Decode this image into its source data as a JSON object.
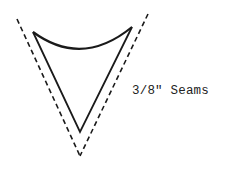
{
  "diagram": {
    "label": "3/8\" Seams",
    "shape": "pattern-piece-triangle",
    "colors": {
      "line": "#1a1a1a",
      "background": "#ffffff"
    },
    "cut_line": {
      "style": "dashed",
      "points": {
        "top_left": [
          17,
          19
        ],
        "top_right": [
          148,
          14
        ],
        "bottom": [
          80,
          156
        ]
      }
    },
    "stitch_line": {
      "style": "solid",
      "points": {
        "top_left": [
          33,
          32
        ],
        "top_right": [
          132,
          27
        ],
        "bottom": [
          80,
          132
        ]
      },
      "top_edge": "curved"
    }
  }
}
